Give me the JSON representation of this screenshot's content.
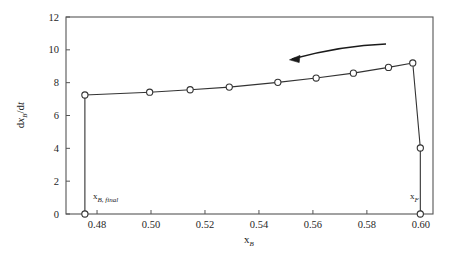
{
  "chart_data": {
    "type": "line",
    "title": "",
    "subtitle": "",
    "xlabel": "x_B",
    "ylabel": "dx_B/dt",
    "xlim": [
      0.4685,
      0.6045
    ],
    "ylim": [
      0,
      12
    ],
    "grid": false,
    "legend": null,
    "marker": "open-circle",
    "series": [
      {
        "name": "batch distillation trajectory",
        "x": [
          0.4755,
          0.4755,
          0.4995,
          0.5145,
          0.529,
          0.547,
          0.5612,
          0.575,
          0.588,
          0.597,
          0.5998,
          0.5998
        ],
        "y": [
          0.0,
          7.25,
          7.42,
          7.57,
          7.73,
          8.02,
          8.28,
          8.58,
          8.93,
          9.2,
          4.02,
          0.0
        ]
      }
    ],
    "xticks": [
      0.48,
      0.5,
      0.52,
      0.54,
      0.56,
      0.58,
      0.6
    ],
    "xtick_labels": [
      "0.48",
      "0.50",
      "0.52",
      "0.54",
      "0.56",
      "0.58",
      "0.60"
    ],
    "yticks": [
      0,
      2,
      4,
      6,
      8,
      10,
      12
    ],
    "ytick_labels": [
      "0",
      "2",
      "4",
      "6",
      "8",
      "10",
      "12"
    ],
    "annotations": [
      {
        "name": "x-b-final-label",
        "text": "x",
        "sub": "B, final",
        "x": 0.4755,
        "y": 0.0
      },
      {
        "name": "x-f-label",
        "text": "x",
        "sub": "F",
        "x": 0.5998,
        "y": 0.0
      },
      {
        "name": "direction-arrow",
        "text": "",
        "description": "curved arrow pointing left along the curve"
      }
    ],
    "colors": {
      "line": "#333333",
      "marker_stroke": "#333333",
      "marker_fill": "#ffffff",
      "axis": "#555555",
      "text": "#1a1a1a",
      "background": "#ffffff"
    }
  },
  "axes": {
    "y_label_main": "d",
    "y_label_var": "x",
    "y_label_sub": "B",
    "y_label_den": "/d",
    "y_label_t": "t",
    "x_label_var": "x",
    "x_label_sub": "B"
  }
}
